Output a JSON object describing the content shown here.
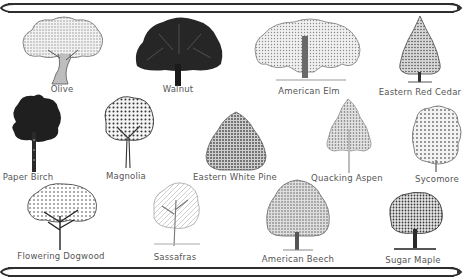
{
  "poster": {
    "frame_color": "#2e2e2e",
    "label_color": "#555555",
    "background": "#ffffff"
  },
  "trees": [
    {
      "name": "Olive",
      "style": "sketch-wide-gnarled"
    },
    {
      "name": "Walnut",
      "style": "solid-dark-round"
    },
    {
      "name": "American Elm",
      "style": "sketch-vase-wide"
    },
    {
      "name": "Eastern Red Cedar",
      "style": "sketch-conical"
    },
    {
      "name": "Paper Birch",
      "style": "solid-dark-tall"
    },
    {
      "name": "Magnolia",
      "style": "sketch-round-thin-trunk"
    },
    {
      "name": "Eastern White Pine",
      "style": "sketch-dense-oval"
    },
    {
      "name": "Quacking Aspen",
      "style": "sketch-triangular-light"
    },
    {
      "name": "Sycomore",
      "style": "sketch-irregular"
    },
    {
      "name": "Flowering Dogwood",
      "style": "sketch-spreading-branches"
    },
    {
      "name": "Sassafras",
      "style": "sketch-bare-light"
    },
    {
      "name": "American Beech",
      "style": "sketch-dome"
    },
    {
      "name": "Sugar Maple",
      "style": "sketch-round-shaded"
    }
  ]
}
